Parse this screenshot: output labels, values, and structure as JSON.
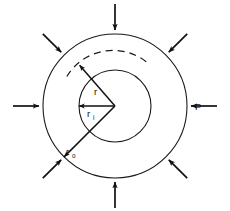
{
  "figure": {
    "background_color": "#ffffff",
    "stroke_color": "#111111"
  },
  "geometry": {
    "center_x": 115,
    "center_y": 106,
    "outer_radius": 72,
    "inner_radius": 36,
    "gauge_radius": 54
  },
  "labels": {
    "pressure": "P",
    "radius_generic": "r",
    "radius_inner_base": "r",
    "radius_inner_sub": "i",
    "radius_outer_base": "r",
    "radius_outer_sub": "o"
  },
  "pressure_arrows": {
    "count": 8,
    "angles_deg": [
      0,
      45,
      90,
      135,
      180,
      225,
      270,
      315
    ],
    "direction": "inward",
    "tail_length": 30,
    "gap_from_surface": 2
  },
  "radius_arrows": [
    {
      "name": "r",
      "angle_deg": 131,
      "length": 54,
      "label": "r"
    },
    {
      "name": "r_i",
      "angle_deg": 180,
      "length": 36,
      "label": "ri"
    },
    {
      "name": "r_o",
      "angle_deg": 225,
      "length": 72,
      "label": "ro"
    }
  ]
}
